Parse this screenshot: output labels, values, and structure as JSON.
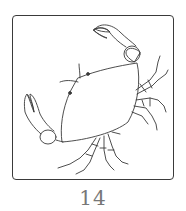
{
  "card": {
    "illustration": "crab-line-drawing",
    "number": "14"
  },
  "colors": {
    "stroke": "#3a3a3a",
    "caption": "#777777",
    "background": "#ffffff"
  }
}
